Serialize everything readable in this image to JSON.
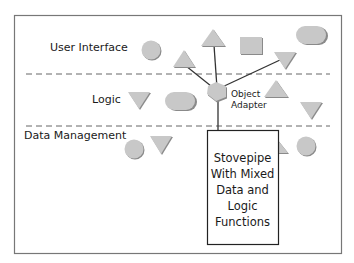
{
  "layers": [
    {
      "label": "User Interface"
    },
    {
      "label": "Logic"
    },
    {
      "label": "Data Management"
    }
  ],
  "object_adapter": {
    "line1": "Object",
    "line2": "Adapter"
  },
  "stovepipe": {
    "lines": [
      "Stovepipe",
      "With Mixed",
      "Data and",
      "Logic",
      "Functions"
    ]
  },
  "colors": {
    "shape_fill": "#c8c8c8",
    "shape_shadow": "#8a8a8a",
    "frame": "#777777",
    "lines": "#333333"
  }
}
